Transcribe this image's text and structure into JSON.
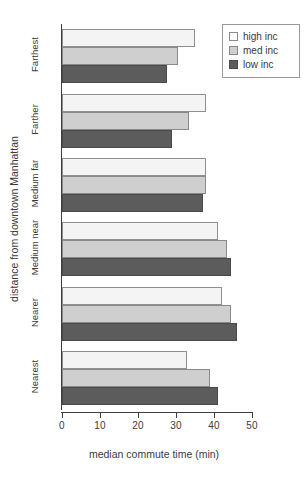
{
  "chart_data": {
    "type": "bar",
    "orientation": "horizontal",
    "title": "",
    "xlabel": "median commute time (min)",
    "ylabel": "distance from downtown Manhattan",
    "categories": [
      "Farthest",
      "Farther",
      "Medium far",
      "Medium near",
      "Nearer",
      "Nearest"
    ],
    "series": [
      {
        "name": "high inc",
        "color": "#f4f4f4",
        "values": [
          35,
          38,
          38,
          41,
          42,
          33
        ]
      },
      {
        "name": "med inc",
        "color": "#cfcfcf",
        "values": [
          30.5,
          33.5,
          38,
          43.5,
          44.5,
          39
        ]
      },
      {
        "name": "low inc",
        "color": "#5c5c5c",
        "values": [
          27.5,
          29,
          37,
          44.5,
          46,
          41
        ]
      }
    ],
    "xlim": [
      0,
      50
    ],
    "xticks": [
      0,
      10,
      20,
      30,
      40,
      50
    ],
    "xtick_labels": [
      "0",
      "10",
      "20",
      "30",
      "40",
      "50"
    ],
    "grid": false,
    "legend_position": "top-right",
    "legend_entries": [
      "high inc",
      "med inc",
      "low inc"
    ]
  },
  "legend": {
    "items": [
      {
        "label": "high inc"
      },
      {
        "label": "med inc"
      },
      {
        "label": "low inc"
      }
    ]
  },
  "axes": {
    "x_title": "median commute time (min)",
    "y_title": "distance from downtown Manhattan",
    "x_tick_labels": [
      "0",
      "10",
      "20",
      "30",
      "40",
      "50"
    ],
    "y_category_labels": [
      "Farthest",
      "Farther",
      "Medium far",
      "Medium near",
      "Nearer",
      "Nearest"
    ]
  }
}
